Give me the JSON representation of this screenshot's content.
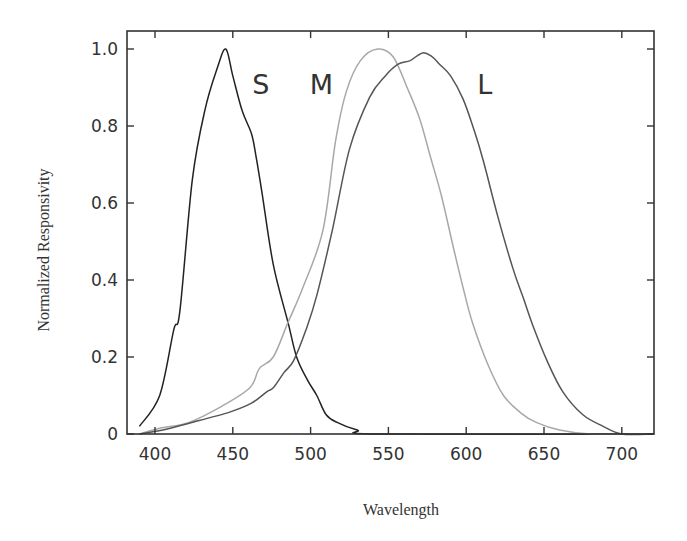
{
  "chart_data": {
    "type": "line",
    "title": "",
    "xlabel": "Wavelength",
    "ylabel": "Normalized Responsivity",
    "xlim": [
      382,
      722
    ],
    "ylim": [
      0,
      1.05
    ],
    "grid": false,
    "legend": "none (inline curve labels S, M, L)",
    "x_ticks": [
      400,
      450,
      500,
      550,
      600,
      650,
      700
    ],
    "x_tick_labels": [
      "400",
      "450",
      "500",
      "550",
      "600",
      "650",
      "700"
    ],
    "y_ticks": [
      0,
      0.2,
      0.4,
      0.6,
      0.8,
      1.0
    ],
    "y_tick_labels": [
      "0",
      "0.2",
      "0.4",
      "0.6",
      "0.8",
      "1.0"
    ],
    "annotations": [
      {
        "text": "S",
        "x": 468,
        "y": 0.9
      },
      {
        "text": "M",
        "x": 507,
        "y": 0.9
      },
      {
        "text": "L",
        "x": 612,
        "y": 0.9
      }
    ],
    "series": [
      {
        "name": "S",
        "color": "#222222",
        "points": [
          [
            390,
            0.02
          ],
          [
            403,
            0.1
          ],
          [
            412,
            0.27
          ],
          [
            416,
            0.32
          ],
          [
            424,
            0.66
          ],
          [
            432,
            0.84
          ],
          [
            440,
            0.95
          ],
          [
            445.5,
            1.0
          ],
          [
            450,
            0.93
          ],
          [
            456,
            0.84
          ],
          [
            462,
            0.78
          ],
          [
            465,
            0.72
          ],
          [
            469,
            0.62
          ],
          [
            476,
            0.44
          ],
          [
            485.5,
            0.29
          ],
          [
            491,
            0.2
          ],
          [
            498,
            0.14
          ],
          [
            504,
            0.1
          ],
          [
            510,
            0.05
          ],
          [
            517,
            0.03
          ],
          [
            530,
            0.01
          ],
          [
            545,
            0.0
          ],
          [
            720,
            0.0
          ]
        ]
      },
      {
        "name": "M",
        "color": "#a8a8a8",
        "points": [
          [
            390,
            0.0
          ],
          [
            403,
            0.015
          ],
          [
            422,
            0.03
          ],
          [
            442,
            0.07
          ],
          [
            461,
            0.12
          ],
          [
            467,
            0.17
          ],
          [
            476,
            0.2
          ],
          [
            485.5,
            0.29
          ],
          [
            495,
            0.38
          ],
          [
            508,
            0.53
          ],
          [
            516,
            0.76
          ],
          [
            523,
            0.89
          ],
          [
            532,
            0.97
          ],
          [
            543,
            1.0
          ],
          [
            553,
            0.98
          ],
          [
            562,
            0.9
          ],
          [
            570,
            0.82
          ],
          [
            577,
            0.72
          ],
          [
            584,
            0.62
          ],
          [
            592,
            0.48
          ],
          [
            598,
            0.38
          ],
          [
            604,
            0.29
          ],
          [
            614,
            0.18
          ],
          [
            624,
            0.1
          ],
          [
            635,
            0.055
          ],
          [
            645,
            0.03
          ],
          [
            660,
            0.01
          ],
          [
            680,
            0.0
          ],
          [
            720,
            0.0
          ]
        ]
      },
      {
        "name": "L",
        "color": "#555555",
        "points": [
          [
            390,
            0.0
          ],
          [
            405,
            0.01
          ],
          [
            422,
            0.028
          ],
          [
            448,
            0.057
          ],
          [
            462,
            0.08
          ],
          [
            472,
            0.11
          ],
          [
            476,
            0.12
          ],
          [
            483,
            0.16
          ],
          [
            489,
            0.19
          ],
          [
            497,
            0.27
          ],
          [
            504,
            0.36
          ],
          [
            514,
            0.53
          ],
          [
            525,
            0.74
          ],
          [
            538,
            0.875
          ],
          [
            548,
            0.93
          ],
          [
            556,
            0.96
          ],
          [
            564,
            0.97
          ],
          [
            572,
            0.99
          ],
          [
            578,
            0.98
          ],
          [
            583,
            0.96
          ],
          [
            590,
            0.93
          ],
          [
            598,
            0.87
          ],
          [
            605,
            0.79
          ],
          [
            611,
            0.71
          ],
          [
            620,
            0.57
          ],
          [
            630,
            0.43
          ],
          [
            637,
            0.35
          ],
          [
            643,
            0.28
          ],
          [
            652,
            0.19
          ],
          [
            662,
            0.11
          ],
          [
            675,
            0.05
          ],
          [
            688,
            0.02
          ],
          [
            700,
            0.0
          ],
          [
            720,
            0.0
          ]
        ]
      }
    ]
  }
}
